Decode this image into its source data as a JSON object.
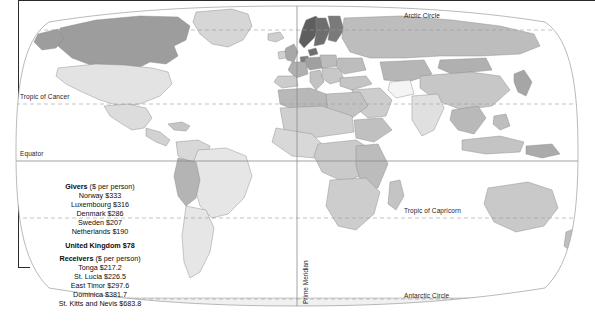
{
  "map": {
    "projection_name": "robinson",
    "graticule_labels": [
      {
        "name": "arctic-circle",
        "text": "Arctic Circle"
      },
      {
        "name": "tropic-of-cancer",
        "text": "Tropic of Cancer"
      },
      {
        "name": "equator",
        "text": "Equator"
      },
      {
        "name": "tropic-of-capricorn",
        "text": "Tropic of Capricorn"
      },
      {
        "name": "antarctic-circle",
        "text": "Antarctic Circle"
      },
      {
        "name": "prime-meridian",
        "text": "Prime Meridian"
      }
    ],
    "colors": {
      "ocean": "#ffffff",
      "outline": "#7a7a7a",
      "graticule": "#9a9a9a",
      "equator": "#8c8c8c",
      "land_lightest": "#f2f2f2",
      "land_light": "#e0e0e0",
      "land_mid": "#c9c9c9",
      "land_dark": "#9d9d9d",
      "land_darkest": "#6e6e6e"
    }
  },
  "legend": {
    "givers": {
      "title": "Givers",
      "unit": "($ per person)",
      "items": [
        "Norway $333",
        "Luxembourg $316",
        "Denmark $286",
        "Sweden $207",
        "Netherlands $190"
      ],
      "highlight": "United Kingdom $78"
    },
    "receivers": {
      "title": "Receivers",
      "unit": "($ per person)",
      "items": [
        "Tonga $217.2",
        "St. Lucia $226.5",
        "East Timor $297.6",
        "Dominica $381.7",
        "St. Kitts and Nevis $683.8"
      ]
    }
  }
}
